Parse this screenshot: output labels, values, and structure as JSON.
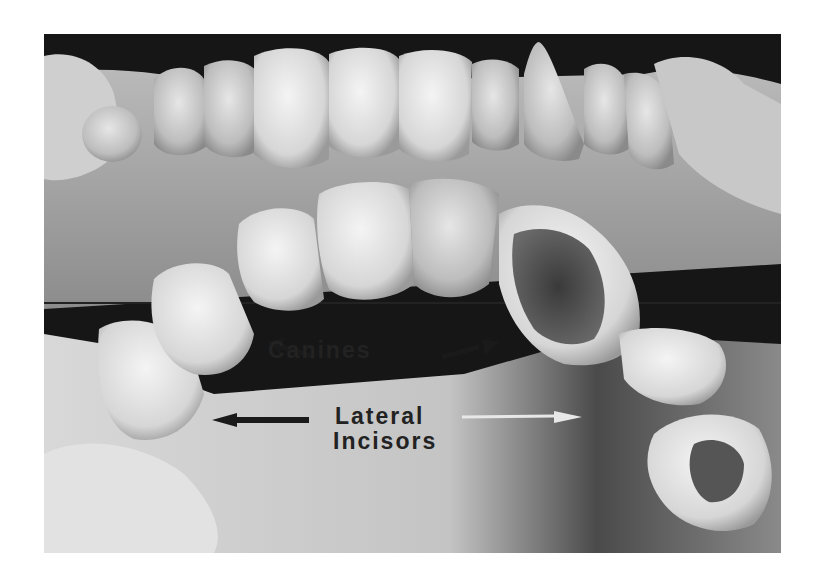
{
  "figure": {
    "labels": {
      "canines": "Canines",
      "lateral_line1": "Lateral",
      "lateral_line2": "Incisors"
    },
    "arrows": [
      {
        "target": "left-canine",
        "color": "#1a1a1a"
      },
      {
        "target": "right-canine",
        "color": "#1a1a1a"
      },
      {
        "target": "left-lateral-incisor",
        "color": "#1a1a1a"
      },
      {
        "target": "right-lateral-incisor",
        "color": "#e8e8e8"
      }
    ]
  }
}
